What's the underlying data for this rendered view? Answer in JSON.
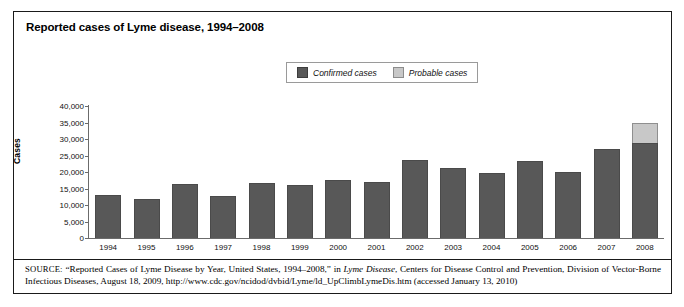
{
  "figure": {
    "title": "Reported cases of Lyme disease, 1994–2008",
    "source_label": "SOURCE:",
    "source_text_1": " “Reported Cases of Lyme Disease by Year, United States, 1994–2008,” in ",
    "source_italic": "Lyme Disease",
    "source_text_2": ", Centers for Disease Control and Prevention, Division of Vector-Borne Infectious Diseases, August 18, 2009, http://www.cdc.gov/ncidod/dvbid/Lyme/ld_UpClimbLymeDis.htm (accessed January 13, 2010)"
  },
  "legend": {
    "confirmed_label": "Confirmed cases",
    "probable_label": "Probable cases"
  },
  "colors": {
    "confirmed": "#585858",
    "probable": "#c8c8c8",
    "axis": "#6b6b6b",
    "frame": "#1a1a1a"
  },
  "chart_data": {
    "type": "bar",
    "title": "Reported cases of Lyme disease, 1994–2008",
    "xlabel": "",
    "ylabel": "Cases",
    "ylim": [
      0,
      40000
    ],
    "yticks": [
      0,
      5000,
      10000,
      15000,
      20000,
      25000,
      30000,
      35000,
      40000
    ],
    "ytick_labels": [
      "0",
      "5,000",
      "10,000",
      "15,000",
      "20,000",
      "25,000",
      "30,000",
      "35,000",
      "40,000"
    ],
    "grid": false,
    "legend_position": "top-center",
    "stacked": true,
    "categories": [
      "1994",
      "1995",
      "1996",
      "1997",
      "1998",
      "1999",
      "2000",
      "2001",
      "2002",
      "2003",
      "2004",
      "2005",
      "2006",
      "2007",
      "2008"
    ],
    "series": [
      {
        "name": "Confirmed cases",
        "color": "#585858",
        "values": [
          13000,
          11700,
          16400,
          12800,
          16800,
          16200,
          17700,
          17000,
          23700,
          21300,
          19800,
          23300,
          19900,
          27100,
          28900
        ]
      },
      {
        "name": "Probable cases",
        "color": "#c8c8c8",
        "values": [
          0,
          0,
          0,
          0,
          0,
          0,
          0,
          0,
          0,
          0,
          0,
          0,
          0,
          0,
          6100
        ]
      }
    ],
    "totals": [
      13000,
      11700,
      16400,
      12800,
      16800,
      16200,
      17700,
      17000,
      23700,
      21300,
      19800,
      23300,
      19900,
      27100,
      35000
    ]
  }
}
